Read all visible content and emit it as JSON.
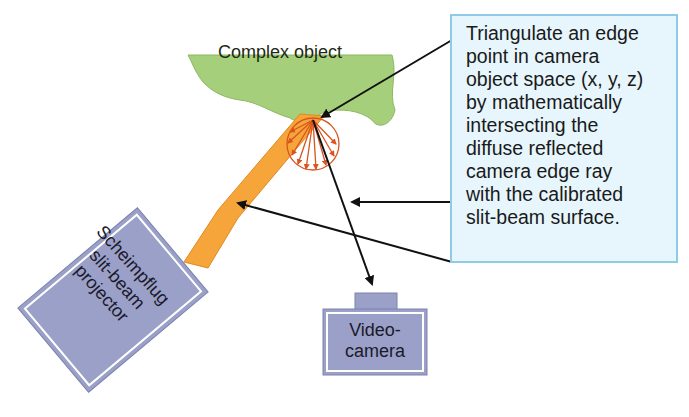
{
  "diagram": {
    "object_label": "Complex object",
    "projector_label": [
      "Scheimpflug",
      "slit-beam",
      "projector"
    ],
    "camera_label": [
      "Video-",
      "camera"
    ],
    "callout_lines": [
      "Triangulate an edge",
      "point in camera",
      "object space (x, y, z)",
      "by mathematically",
      "intersecting the",
      "diffuse reflected",
      "camera edge ray",
      "with the calibrated",
      "slit-beam surface."
    ],
    "colors": {
      "object_fill": "#a5cf7a",
      "beam_fill": "#f5a53a",
      "reflection": "#d9541e",
      "device_fill": "#9aa0c8",
      "callout_fill": "#e7f6fc",
      "callout_border": "#8fcbe6",
      "arrow": "#111111"
    }
  }
}
